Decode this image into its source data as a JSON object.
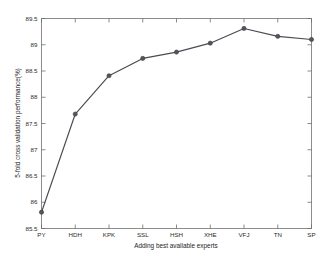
{
  "chart_data": {
    "type": "line",
    "title": "",
    "xlabel": "Adding best available experts",
    "ylabel": "5-fold cross validation performance(%)",
    "categories": [
      "PY",
      "HDH",
      "KPK",
      "SSL",
      "HSH",
      "XHE",
      "VFJ",
      "TN",
      "SP"
    ],
    "values": [
      85.81,
      87.68,
      88.41,
      88.74,
      88.86,
      89.03,
      89.31,
      89.16,
      89.1
    ],
    "ylim": [
      85.5,
      89.5
    ],
    "yticks": [
      "85.5",
      "86",
      "86.5",
      "87",
      "87.5",
      "88",
      "88.5",
      "89",
      "89.5"
    ],
    "ytick_values": [
      85.5,
      86,
      86.5,
      87,
      87.5,
      88,
      88.5,
      89,
      89.5
    ],
    "xticks": [
      "PY",
      "HDH",
      "KPK",
      "SSL",
      "HSH",
      "XHE",
      "VFJ",
      "TN",
      "SP"
    ],
    "grid": false,
    "legend": null,
    "marker": "circle",
    "line_color": "#4a4a52",
    "marker_color": "#55555d"
  },
  "axes": {
    "y_axis_name": "5-fold cross validation performance(%)",
    "x_axis_name": "Adding best available experts"
  }
}
